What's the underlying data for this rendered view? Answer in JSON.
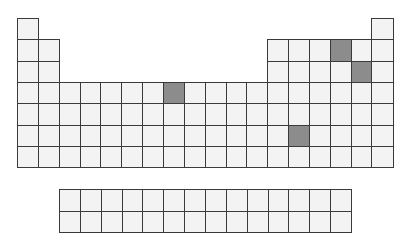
{
  "diagram": {
    "type": "periodic-table-outline",
    "colors": {
      "cell_fill": "#f3f3f3",
      "highlight_fill": "#8c8c8c",
      "border": "#3a3a3a",
      "background": "#ffffff"
    },
    "layout": {
      "main": {
        "left": 17,
        "top": 18,
        "cell_w": 20.85,
        "cell_h": 21.3,
        "columns": 18,
        "periods": 7
      },
      "f_block": {
        "left": 59,
        "top": 189,
        "cell_w": 20.85,
        "cell_h": 21.5,
        "columns": 14,
        "rows": 2
      }
    },
    "highlighted_cells": [
      {
        "period": 2,
        "group": 16
      },
      {
        "period": 3,
        "group": 17
      },
      {
        "period": 4,
        "group": 8
      },
      {
        "period": 6,
        "group": 14
      }
    ]
  }
}
